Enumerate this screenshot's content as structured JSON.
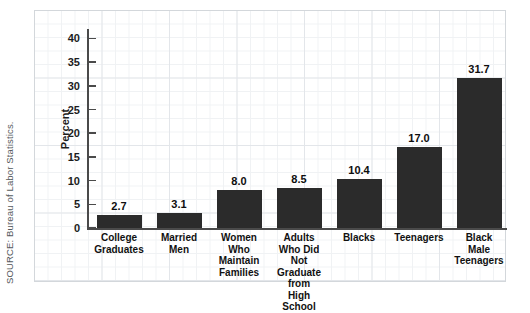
{
  "source_note": "SOURCE: Bureau of Labor Statistics.",
  "axis": {
    "y_title": "Percent",
    "y_ticks": [
      "40",
      "35",
      "30",
      "25",
      "20",
      "15",
      "10",
      "5",
      "0"
    ]
  },
  "colors": {
    "bar": "#2b2b2b",
    "axis": "#4a4a4a",
    "grid_minor": "#f0f2f4",
    "grid_major": "#e3e6ea",
    "frame_border": "#d3d7db",
    "text": "#111111",
    "source_text": "#55595c"
  },
  "chart_data": {
    "type": "bar",
    "title": "",
    "xlabel": "",
    "ylabel": "Percent",
    "ylim": [
      0,
      42
    ],
    "grid": true,
    "legend": "none",
    "categories": [
      "College\nGraduates",
      "Married\nMen",
      "Women\nWho\nMaintain\nFamilies",
      "Adults\nWho Did Not\nGraduate from\nHigh School",
      "Blacks",
      "Teenagers",
      "Black\nMale\nTeenagers"
    ],
    "values": [
      2.7,
      3.1,
      8.0,
      8.5,
      10.4,
      17.0,
      31.7
    ],
    "value_labels": [
      "2.7",
      "3.1",
      "8.0",
      "8.5",
      "10.4",
      "17.0",
      "31.7"
    ],
    "ytick_values": [
      40,
      35,
      30,
      25,
      20,
      15,
      10,
      5,
      0
    ]
  }
}
